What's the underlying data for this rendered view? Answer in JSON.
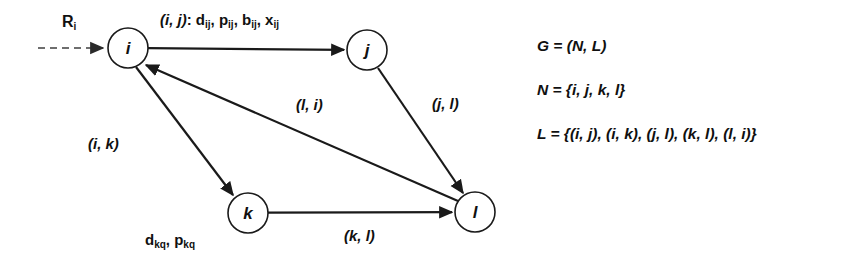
{
  "diagram": {
    "nodes": [
      {
        "id": "i",
        "label": "i",
        "cx": 128,
        "cy": 48,
        "r": 20
      },
      {
        "id": "j",
        "label": "j",
        "cx": 367,
        "cy": 50,
        "r": 20
      },
      {
        "id": "k",
        "label": "k",
        "cx": 248,
        "cy": 213,
        "r": 20
      },
      {
        "id": "l",
        "label": "l",
        "cx": 475,
        "cy": 212,
        "r": 20
      }
    ],
    "source_label": {
      "base": "R",
      "sub": "i",
      "x": 62,
      "y": 14
    },
    "edge_labels": [
      {
        "id": "ij",
        "prefix": "(i, j)",
        "sep": ": ",
        "params": "d, p, b, x",
        "sub": "ij",
        "x": 160,
        "y": 12
      },
      {
        "id": "ik",
        "text": "(i, k)",
        "x": 88,
        "y": 136
      },
      {
        "id": "li",
        "text": "(l, i)",
        "x": 296,
        "y": 97
      },
      {
        "id": "jl",
        "text": "(j, l)",
        "x": 432,
        "y": 96
      },
      {
        "id": "kl",
        "text": "(k, l)",
        "x": 344,
        "y": 228
      }
    ],
    "param_label_kq": {
      "d": "d",
      "p": "p",
      "sub": "kq",
      "x": 145,
      "y": 232
    },
    "edges": [
      {
        "from": "source",
        "to": "i",
        "style": "dashed",
        "label": "R_i"
      },
      {
        "from": "i",
        "to": "j",
        "style": "solid",
        "label": "(i, j)"
      },
      {
        "from": "i",
        "to": "k",
        "style": "solid",
        "label": "(i, k)"
      },
      {
        "from": "j",
        "to": "l",
        "style": "solid",
        "label": "(j, l)"
      },
      {
        "from": "k",
        "to": "l",
        "style": "solid",
        "label": "(k, l)"
      },
      {
        "from": "l",
        "to": "i",
        "style": "solid",
        "label": "(l, i)"
      }
    ]
  },
  "legend": {
    "lines": [
      {
        "id": "graph-def",
        "text": "G = (N, L)"
      },
      {
        "id": "node-set",
        "text": "N = {i, j, k, l}"
      },
      {
        "id": "link-set",
        "text": "L = {(i, j), (i, k), (j, l), (k, l), (l, i)}"
      }
    ]
  },
  "colors": {
    "stroke": "#1a1a1a",
    "dashed_stroke": "#6e6e6e",
    "text": "#101010",
    "background": "#ffffff"
  }
}
